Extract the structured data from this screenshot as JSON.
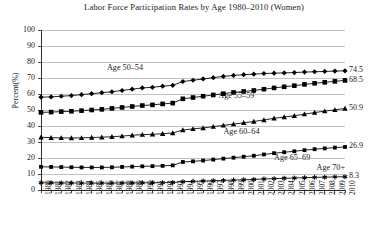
{
  "chart_data": {
    "type": "line",
    "title": "Labor Force Participation Rates by Age 1980–2010 (Women)",
    "xlabel": "",
    "ylabel": "Percent(%)",
    "ylim": [
      0,
      100
    ],
    "ytick_step": 10,
    "yticks": [
      "100",
      "90",
      "80",
      "70",
      "60",
      "50",
      "40",
      "30",
      "20",
      "10",
      "0"
    ],
    "grid": true,
    "legend_position": "inline-annotations",
    "categories": [
      "1980",
      "1981",
      "1982",
      "1983",
      "1984",
      "1985",
      "1986",
      "1987",
      "1988",
      "1989",
      "1990",
      "1991",
      "1992",
      "1993",
      "1994",
      "1995",
      "1996",
      "1997",
      "1998",
      "1999",
      "2000",
      "2001",
      "2002",
      "2003",
      "2004",
      "2005",
      "2006",
      "2007",
      "2008",
      "2009",
      "2010"
    ],
    "series": [
      {
        "name": "Age 50–54",
        "marker": "diamond",
        "end_value_label": "74.5",
        "values": [
          58.0,
          58.2,
          58.6,
          59.0,
          59.6,
          60.2,
          60.8,
          61.4,
          62.2,
          63.0,
          63.8,
          64.2,
          64.9,
          65.4,
          67.8,
          68.6,
          69.4,
          70.2,
          71.0,
          71.6,
          72.1,
          72.4,
          72.8,
          73.0,
          73.2,
          73.4,
          73.7,
          73.9,
          74.1,
          74.3,
          74.5
        ]
      },
      {
        "name": "Age 55–59",
        "marker": "square",
        "end_value_label": "68.5",
        "values": [
          48.5,
          48.7,
          49.0,
          49.2,
          49.6,
          50.0,
          50.4,
          51.0,
          51.6,
          52.2,
          52.8,
          53.2,
          53.8,
          54.3,
          57.0,
          57.8,
          58.6,
          59.4,
          60.2,
          61.0,
          61.6,
          62.2,
          63.0,
          63.8,
          64.5,
          65.2,
          66.0,
          66.7,
          67.3,
          67.9,
          68.5
        ]
      },
      {
        "name": "Age 60–64",
        "marker": "triangle",
        "end_value_label": "50.9",
        "values": [
          33.0,
          32.7,
          32.6,
          32.5,
          32.6,
          32.8,
          33.0,
          33.3,
          33.7,
          34.2,
          34.6,
          34.8,
          35.2,
          35.6,
          37.5,
          38.2,
          38.8,
          39.6,
          40.4,
          41.2,
          42.0,
          42.8,
          43.8,
          44.8,
          45.6,
          46.4,
          47.4,
          48.4,
          49.3,
          50.1,
          50.9
        ]
      },
      {
        "name": "Age 65–69",
        "marker": "small-square",
        "end_value_label": "26.9",
        "values": [
          14.5,
          14.4,
          14.3,
          14.2,
          14.1,
          14.1,
          14.1,
          14.2,
          14.4,
          14.6,
          14.8,
          14.9,
          15.1,
          15.4,
          17.5,
          17.9,
          18.4,
          19.0,
          19.6,
          20.2,
          20.8,
          21.4,
          22.2,
          23.0,
          23.6,
          24.2,
          24.9,
          25.5,
          26.0,
          26.5,
          26.9
        ]
      },
      {
        "name": "Age 70+",
        "marker": "asterisk",
        "end_value_label": "8.3",
        "values": [
          4.5,
          4.5,
          4.4,
          4.4,
          4.3,
          4.3,
          4.3,
          4.3,
          4.4,
          4.4,
          4.5,
          4.5,
          4.6,
          4.7,
          5.2,
          5.4,
          5.6,
          5.8,
          6.0,
          6.2,
          6.4,
          6.6,
          6.9,
          7.1,
          7.3,
          7.5,
          7.7,
          7.9,
          8.0,
          8.2,
          8.3
        ]
      }
    ],
    "annotations": [
      {
        "text": "Age 50–54",
        "x": 1986.5,
        "y": 76.0
      },
      {
        "text": "Age 55–59",
        "x": 1997.5,
        "y": 58.5
      },
      {
        "text": "Age 60–64",
        "x": 1998.0,
        "y": 36.5
      },
      {
        "text": "Age 65–69",
        "x": 2003.0,
        "y": 20.0
      },
      {
        "text": "Age 70+",
        "x": 2007.2,
        "y": 14.0
      }
    ]
  }
}
